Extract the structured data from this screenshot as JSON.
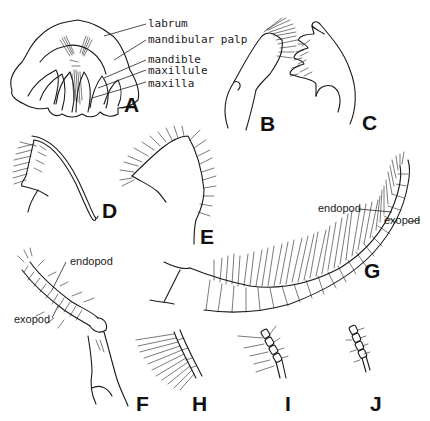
{
  "figure": {
    "background": "#ffffff",
    "ink_color": "#1a1a1a",
    "panels": [
      {
        "id": "A",
        "letter": "A",
        "subject": "mouthparts-assembly",
        "callouts": [
          "labrum",
          "mandibular palp",
          "mandible",
          "maxillule",
          "maxilla"
        ]
      },
      {
        "id": "B",
        "letter": "B",
        "subject": "appendage-setose-lobe"
      },
      {
        "id": "C",
        "letter": "C",
        "subject": "mandible-toothed"
      },
      {
        "id": "D",
        "letter": "D",
        "subject": "appendage-curved-spine"
      },
      {
        "id": "E",
        "letter": "E",
        "subject": "appendage-setose-lobe-large"
      },
      {
        "id": "F",
        "letter": "F",
        "subject": "biramous-appendage",
        "callouts": [
          "endopod",
          "exopod"
        ]
      },
      {
        "id": "G",
        "letter": "G",
        "subject": "biramous-ramus-curved",
        "callouts": [
          "endopod",
          "exopod"
        ]
      },
      {
        "id": "H",
        "letter": "H",
        "subject": "ramus-segment-setae-long"
      },
      {
        "id": "I",
        "letter": "I",
        "subject": "ramus-segment-setae-medium"
      },
      {
        "id": "J",
        "letter": "J",
        "subject": "ramus-segment-setae-short"
      }
    ],
    "labels": {
      "A": {
        "labrum": "labrum",
        "mandibular_palp": "mandibular palp",
        "mandible": "mandible",
        "maxillule": "maxillule",
        "maxilla": "maxilla"
      },
      "F": {
        "endopod": "endopod",
        "exopod": "exopod"
      },
      "G": {
        "endopod": "endopod",
        "exopod": "exopod"
      }
    },
    "letters": {
      "A": "A",
      "B": "B",
      "C": "C",
      "D": "D",
      "E": "E",
      "F": "F",
      "G": "G",
      "H": "H",
      "I": "I",
      "J": "J"
    }
  }
}
